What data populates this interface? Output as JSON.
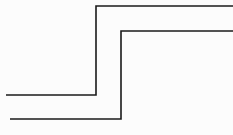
{
  "figure": {
    "width": 233,
    "height": 135,
    "background_color": "#fcfcfc",
    "stroke_color": "#1a1a1a",
    "stroke_width": 1.6
  },
  "chart_data": {
    "type": "line",
    "title": "",
    "subtitle": "",
    "xlabel": "",
    "ylabel": "",
    "xlim": [
      0,
      233
    ],
    "ylim": [
      0,
      135
    ],
    "grid": false,
    "legend": null,
    "axes_visible": false,
    "tick_labels_x": [],
    "tick_labels_y": [],
    "annotations": [],
    "series": [
      {
        "name": "upper-step-line",
        "color": "#1a1a1a",
        "style": "solid",
        "points": [
          [
            6,
            95
          ],
          [
            96,
            95
          ],
          [
            96,
            6
          ],
          [
            233,
            6
          ]
        ]
      },
      {
        "name": "lower-step-line",
        "color": "#1a1a1a",
        "style": "solid",
        "points": [
          [
            10,
            119
          ],
          [
            121,
            119
          ],
          [
            121,
            31
          ],
          [
            233,
            31
          ]
        ]
      }
    ]
  }
}
